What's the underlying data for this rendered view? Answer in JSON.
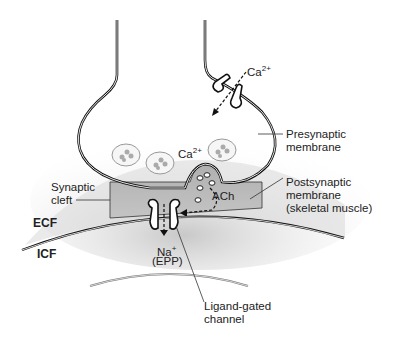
{
  "diagram": {
    "labels": {
      "ca_outside": {
        "base": "Ca",
        "sup": "2+"
      },
      "ca_inside": {
        "base": "Ca",
        "sup": "2+"
      },
      "presynaptic_line1": "Presynaptic",
      "presynaptic_line2": "membrane",
      "synaptic_cleft_line1": "Synaptic",
      "synaptic_cleft_line2": "cleft",
      "ach": "ACh",
      "postsynaptic_line1": "Postsynaptic",
      "postsynaptic_line2": "membrane",
      "postsynaptic_line3": "(skeletal muscle)",
      "ecf": "ECF",
      "icf": "ICF",
      "na": {
        "base": "Na",
        "sup": "+"
      },
      "epp": "(EPP)",
      "ligand_line1": "Ligand-gated",
      "ligand_line2": "channel"
    },
    "colors": {
      "membrane": "#1a1a1a",
      "cleft_fill": "#b8b8b8",
      "vesicle_stroke": "#888888",
      "text": "#222222"
    }
  }
}
